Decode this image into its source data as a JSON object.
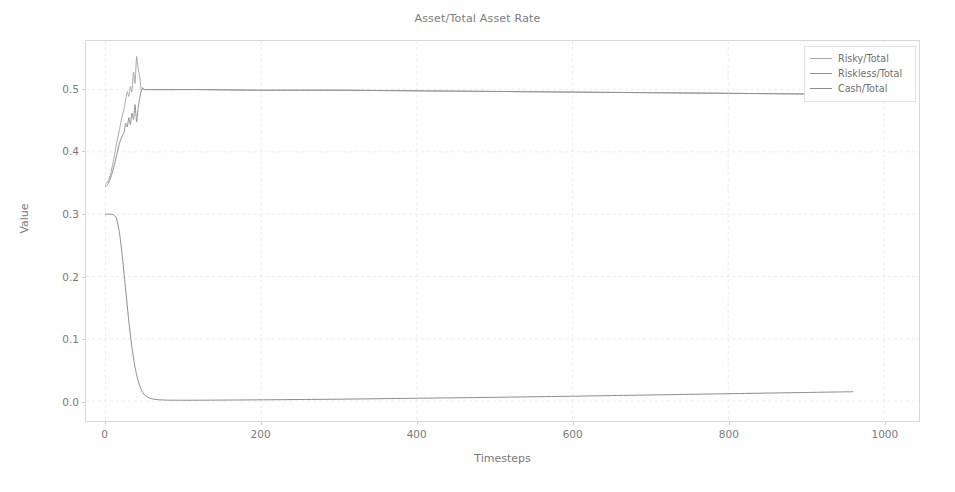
{
  "chart_data": {
    "type": "line",
    "title": "Asset/Total Asset Rate",
    "xlabel": "Timesteps",
    "ylabel": "Value",
    "xlim": [
      -25,
      1045
    ],
    "ylim": [
      -0.032,
      0.578
    ],
    "xticks": [
      0,
      200,
      400,
      600,
      800,
      1000
    ],
    "xticklabels": [
      "0",
      "200",
      "400",
      "600",
      "800",
      "1000"
    ],
    "yticks": [
      0.0,
      0.1,
      0.2,
      0.3,
      0.4,
      0.5
    ],
    "yticklabels": [
      "0.0",
      "0.1",
      "0.2",
      "0.3",
      "0.4",
      "0.5"
    ],
    "grid": true,
    "grid_style": "dashed",
    "legend_position": "upper right",
    "series": [
      {
        "name": "Risky/Total",
        "color": "#a8a8a8",
        "x": [
          0,
          3,
          6,
          9,
          12,
          15,
          18,
          21,
          24,
          26,
          28,
          30,
          32,
          34,
          36,
          38,
          40,
          42,
          44,
          46,
          48,
          50,
          53,
          56,
          60,
          70,
          90,
          120,
          200,
          300,
          400,
          500,
          600,
          700,
          800,
          900,
          1000
        ],
        "y": [
          0.348,
          0.352,
          0.362,
          0.378,
          0.398,
          0.418,
          0.436,
          0.455,
          0.47,
          0.484,
          0.497,
          0.489,
          0.505,
          0.496,
          0.528,
          0.51,
          0.553,
          0.534,
          0.52,
          0.499,
          0.503,
          0.5,
          0.5,
          0.5,
          0.5,
          0.5,
          0.5,
          0.5,
          0.499,
          0.499,
          0.498,
          0.497,
          0.496,
          0.495,
          0.494,
          0.493,
          0.493
        ]
      },
      {
        "name": "Riskless/Total",
        "color": "#909090",
        "x": [
          0,
          3,
          6,
          9,
          12,
          15,
          18,
          21,
          24,
          26,
          28,
          30,
          32,
          34,
          36,
          38,
          40,
          42,
          44,
          46,
          48,
          50,
          53,
          56,
          60,
          70,
          90,
          120,
          200,
          300,
          400,
          500,
          600,
          700,
          800,
          900,
          1000
        ],
        "y": [
          0.344,
          0.348,
          0.356,
          0.368,
          0.382,
          0.398,
          0.414,
          0.424,
          0.432,
          0.446,
          0.44,
          0.455,
          0.444,
          0.462,
          0.452,
          0.476,
          0.448,
          0.47,
          0.487,
          0.498,
          0.501,
          0.5,
          0.5,
          0.5,
          0.5,
          0.5,
          0.5,
          0.5,
          0.499,
          0.499,
          0.498,
          0.497,
          0.496,
          0.495,
          0.494,
          0.493,
          0.493
        ]
      },
      {
        "name": "Cash/Total",
        "color": "#8c8c8c",
        "x": [
          0,
          5,
          10,
          14,
          18,
          22,
          26,
          30,
          34,
          38,
          42,
          46,
          50,
          56,
          62,
          70,
          80,
          100,
          140,
          200,
          300,
          400,
          500,
          600,
          700,
          800,
          900,
          960
        ],
        "y": [
          0.3,
          0.3,
          0.299,
          0.294,
          0.27,
          0.228,
          0.178,
          0.128,
          0.086,
          0.054,
          0.032,
          0.018,
          0.01,
          0.005,
          0.003,
          0.002,
          0.0015,
          0.0013,
          0.0015,
          0.002,
          0.003,
          0.0045,
          0.006,
          0.0078,
          0.0098,
          0.0118,
          0.0138,
          0.015
        ]
      }
    ]
  },
  "legend": {
    "items": [
      {
        "label": "Risky/Total"
      },
      {
        "label": "Riskless/Total"
      },
      {
        "label": "Cash/Total"
      }
    ]
  }
}
